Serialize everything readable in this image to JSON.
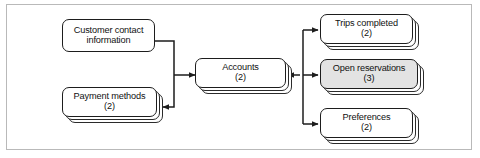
{
  "diagram": {
    "frame": {
      "border_color": "#b9b9b9",
      "background": "#ffffff"
    },
    "style": {
      "box_border_color": "#1d1d1d",
      "box_fill": "#ffffff",
      "shaded_fill": "#e3e3e3",
      "connector_color": "#1d1d1d"
    },
    "nodes": [
      {
        "id": "customer-contact-information",
        "label": "Customer contact information",
        "label_line1": "Customer contact",
        "label_line2": "information",
        "count": "",
        "stacked": false,
        "shaded": false
      },
      {
        "id": "payment-methods",
        "label": "Payment methods",
        "count": "(2)",
        "stacked": true,
        "shaded": false
      },
      {
        "id": "accounts",
        "label": "Accounts",
        "count": "(2)",
        "stacked": true,
        "shaded": false
      },
      {
        "id": "trips-completed",
        "label": "Trips completed",
        "count": "(2)",
        "stacked": true,
        "shaded": false
      },
      {
        "id": "open-reservations",
        "label": "Open reservations",
        "count": "(3)",
        "stacked": true,
        "shaded": true
      },
      {
        "id": "preferences",
        "label": "Preferences",
        "count": "(2)",
        "stacked": true,
        "shaded": false
      }
    ],
    "connectors": [
      {
        "from": "customer-contact-information",
        "to": "accounts",
        "arrow": "to"
      },
      {
        "from": "accounts",
        "to": "payment-methods",
        "arrow": "to"
      },
      {
        "from": "accounts",
        "to": "trips-completed",
        "arrow": "to"
      },
      {
        "from": "accounts",
        "to": "open-reservations",
        "arrow": "both"
      },
      {
        "from": "accounts",
        "to": "preferences",
        "arrow": "to"
      }
    ]
  }
}
